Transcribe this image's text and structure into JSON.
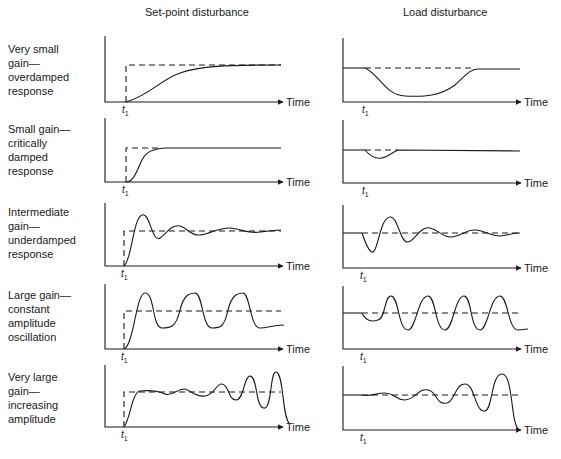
{
  "columns": [
    {
      "title": "Set-point disturbance"
    },
    {
      "title": "Load disturbance"
    }
  ],
  "rows": [
    {
      "label": "Very small\ngain—\noverdamped\nresponse"
    },
    {
      "label": "Small gain—\ncritically\ndamped\nresponse"
    },
    {
      "label": "Intermediate\ngain—\nunderdamped\nresponse"
    },
    {
      "label": "Large gain—\nconstant\namplitude\noscillation"
    },
    {
      "label": "Very large\ngain—\nincreasing\namplitude"
    }
  ],
  "axis": {
    "x_label": "Time",
    "event_marker": "t",
    "event_marker_sub": "1"
  },
  "colors": {
    "line": "#1a1a1a",
    "background": "#ffffff"
  }
}
